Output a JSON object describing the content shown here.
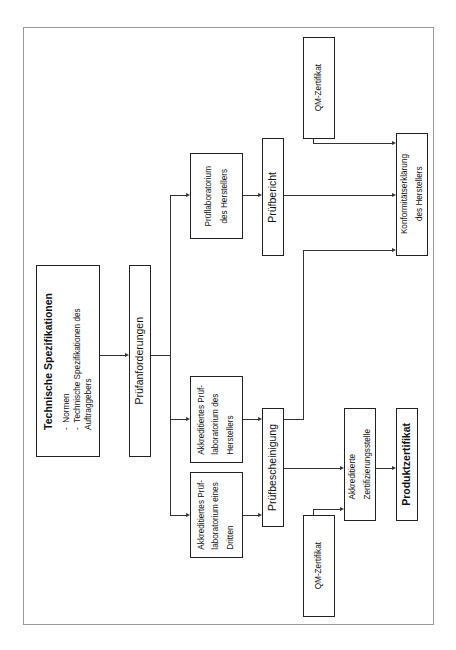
{
  "diagram": {
    "orientation": "rotated-90-ccw",
    "nodes": {
      "tech_spec": {
        "title": "Technische Spezifikationen",
        "bullets": [
          "Normen",
          "Technische Spezifikationen des Auftraggebers"
        ],
        "bullet_lines": [
          "Normen",
          "Technische Spezifikationen des",
          "Auftraggebers"
        ]
      },
      "pruefanforderungen": {
        "label": "Prüfanforderungen"
      },
      "lab_hersteller": {
        "line1": "Prüflaboratorium",
        "line2": "des Herstellers"
      },
      "akkr_lab_hersteller": {
        "line1": "Akkreditiertes Prüf-",
        "line2": "laboratorium des",
        "line3": "Herstellers"
      },
      "akkr_lab_dritter": {
        "line1": "Akkreditiertes Prüf-",
        "line2": "laboratorium eines",
        "line3": "Dritten"
      },
      "pruefbericht": {
        "label": "Prüfbericht"
      },
      "pruefbescheinigung": {
        "label": "Prüfbescheinigung"
      },
      "qm_top": {
        "label": "QM-Zertifikat"
      },
      "qm_bottom": {
        "label": "QM-Zertifikat"
      },
      "konformitaet": {
        "line1": "Konformitätserklärung",
        "line2": "des Herstellers"
      },
      "akkr_zert": {
        "line1": "Akkreditierte",
        "line2": "Zertifizierungsstelle"
      },
      "produktzertifikat": {
        "label": "Produktzertifikat"
      }
    },
    "edges": [
      [
        "Technische Spezifikationen",
        "Prüfanforderungen"
      ],
      [
        "Prüfanforderungen",
        "Prüflaboratorium des Herstellers"
      ],
      [
        "Prüfanforderungen",
        "Akkreditiertes Prüflaboratorium des Herstellers"
      ],
      [
        "Prüfanforderungen",
        "Akkreditiertes Prüflaboratorium eines Dritten"
      ],
      [
        "Prüflaboratorium des Herstellers",
        "Prüfbericht"
      ],
      [
        "Akkreditiertes Prüflaboratorium des Herstellers",
        "Prüfbescheinigung"
      ],
      [
        "Akkreditiertes Prüflaboratorium eines Dritten",
        "Prüfbescheinigung"
      ],
      [
        "Prüfbericht",
        "Konformitätserklärung des Herstellers"
      ],
      [
        "Prüfbescheinigung",
        "Konformitätserklärung des Herstellers"
      ],
      [
        "QM-Zertifikat",
        "Konformitätserklärung des Herstellers"
      ],
      [
        "Prüfbescheinigung",
        "Akkreditierte Zertifizierungsstelle"
      ],
      [
        "QM-Zertifikat",
        "Akkreditierte Zertifizierungsstelle"
      ],
      [
        "Akkreditierte Zertifizierungsstelle",
        "Produktzertifikat"
      ]
    ]
  }
}
